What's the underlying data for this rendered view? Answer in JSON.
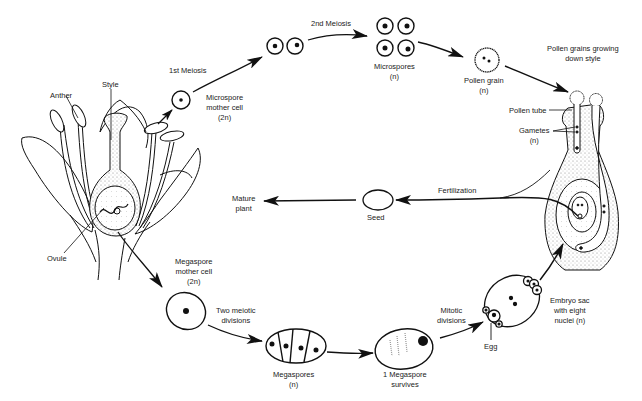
{
  "diagram": {
    "type": "life-cycle",
    "stroke_color": "#111111",
    "stipple_color": "#9a9a9a",
    "background": "#ffffff"
  },
  "flower": {
    "labels": {
      "anther": "Anther",
      "style": "Style",
      "ovule": "Ovule"
    }
  },
  "male_pathway": {
    "step1": {
      "label": "1st Meiosis"
    },
    "microspore_mother_cell": {
      "line1": "Microspore",
      "line2": "mother cell",
      "ploidy": "(2n)"
    },
    "step2": {
      "label": "2nd Meiosis"
    },
    "microspores": {
      "label": "Microspores",
      "ploidy": "(n)"
    },
    "pollen_grain": {
      "label": "Pollen grain",
      "ploidy": "(n)"
    },
    "pollen_growing": {
      "line1": "Pollen grains growing",
      "line2": "down style"
    },
    "pollen_tube": {
      "label": "Pollen tube"
    },
    "gametes": {
      "label": "Gametes",
      "ploidy": "(n)"
    }
  },
  "female_pathway": {
    "megaspore_mother_cell": {
      "line1": "Megaspore",
      "line2": "mother cell",
      "ploidy": "(2n)"
    },
    "two_meiotic": {
      "line1": "Two meiotic",
      "line2": "divisions"
    },
    "megaspores": {
      "label": "Megaspores",
      "ploidy": "(n)"
    },
    "survives": {
      "line1": "1 Megaspore",
      "line2": "survives"
    },
    "mitotic": {
      "line1": "Mitotic",
      "line2": "divisions"
    },
    "egg": {
      "label": "Egg"
    },
    "embryo_sac": {
      "line1": "Embryo sac",
      "line2": "with eight",
      "line3": "nuclei (n)"
    }
  },
  "outcome": {
    "fertilization": {
      "label": "Fertilization"
    },
    "seed": {
      "label": "Seed"
    },
    "mature_plant": {
      "line1": "Mature",
      "line2": "plant"
    }
  }
}
